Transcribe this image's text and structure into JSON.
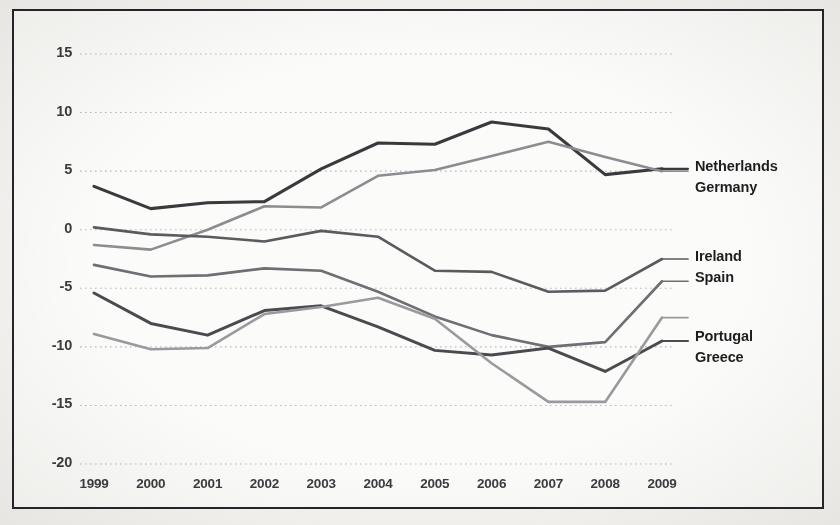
{
  "chart_data": {
    "type": "line",
    "title": "",
    "subtitle": "",
    "xlabel": "",
    "ylabel": "",
    "x": [
      1999,
      2000,
      2001,
      2002,
      2003,
      2004,
      2005,
      2006,
      2007,
      2008,
      2009
    ],
    "xtick_labels": [
      "1999",
      "2000",
      "2001",
      "2002",
      "2003",
      "2004",
      "2005",
      "2006",
      "2007",
      "2008",
      "2009"
    ],
    "ytick_labels": [
      "15",
      "10",
      "5",
      "0",
      "-5",
      "-10",
      "-15",
      "-20"
    ],
    "ytick_values": [
      15,
      10,
      5,
      0,
      -5,
      -10,
      -15,
      -20
    ],
    "ylim": [
      -20,
      15
    ],
    "xlim": [
      1999,
      2009
    ],
    "grid": "horizontal-dotted",
    "legend_position": "right-inline-labels",
    "series": [
      {
        "name": "Netherlands",
        "color": "#3a3a3e",
        "width": 3.1,
        "label_value": 5.2,
        "values": [
          3.7,
          1.8,
          2.3,
          2.4,
          5.2,
          7.4,
          7.3,
          9.2,
          8.6,
          4.7,
          5.2
        ]
      },
      {
        "name": "Germany",
        "color": "#8d8d91",
        "width": 2.6,
        "label_value": 5.0,
        "values": [
          -1.3,
          -1.7,
          0.0,
          2.0,
          1.9,
          4.6,
          5.1,
          6.3,
          7.5,
          6.2,
          5.0
        ]
      },
      {
        "name": "Ireland",
        "color": "#5a5a5f",
        "width": 2.6,
        "label_value": -2.5,
        "values": [
          0.2,
          -0.4,
          -0.6,
          -1.0,
          -0.1,
          -0.6,
          -3.5,
          -3.6,
          -5.3,
          -5.2,
          -2.5
        ]
      },
      {
        "name": "Spain",
        "color": "#6e6e73",
        "width": 2.6,
        "label_value": -4.4,
        "values": [
          -3.0,
          -4.0,
          -3.9,
          -3.3,
          -3.5,
          -5.3,
          -7.4,
          -9.0,
          -10.0,
          -9.6,
          -4.4
        ]
      },
      {
        "name": "Portugal",
        "color": "#4a4a4f",
        "width": 3.0,
        "label_value": -9.5,
        "values": [
          -5.4,
          -8.0,
          -9.0,
          -6.9,
          -6.5,
          -8.3,
          -10.3,
          -10.7,
          -10.1,
          -12.1,
          -9.5
        ]
      },
      {
        "name": "Greece",
        "color": "#9a9a9e",
        "width": 2.6,
        "label_value": -7.5,
        "values": [
          -8.9,
          -10.2,
          -10.1,
          -7.2,
          -6.6,
          -5.8,
          -7.6,
          -11.4,
          -14.7,
          -14.7,
          -7.5
        ]
      }
    ]
  },
  "axis": {
    "y_ticks": [
      {
        "label": "15",
        "value": 15
      },
      {
        "label": "10",
        "value": 10
      },
      {
        "label": "5",
        "value": 5
      },
      {
        "label": "0",
        "value": 0
      },
      {
        "label": "-5",
        "value": -5
      },
      {
        "label": "-10",
        "value": -10
      },
      {
        "label": "-15",
        "value": -15
      },
      {
        "label": "-20",
        "value": -20
      }
    ],
    "x_ticks": [
      {
        "label": "1999"
      },
      {
        "label": "2000"
      },
      {
        "label": "2001"
      },
      {
        "label": "2002"
      },
      {
        "label": "2003"
      },
      {
        "label": "2004"
      },
      {
        "label": "2005"
      },
      {
        "label": "2006"
      },
      {
        "label": "2007"
      },
      {
        "label": "2008"
      },
      {
        "label": "2009"
      }
    ]
  },
  "labels": {
    "netherlands": "Netherlands",
    "germany": "Germany",
    "ireland": "Ireland",
    "spain": "Spain",
    "portugal": "Portugal",
    "greece": "Greece"
  }
}
